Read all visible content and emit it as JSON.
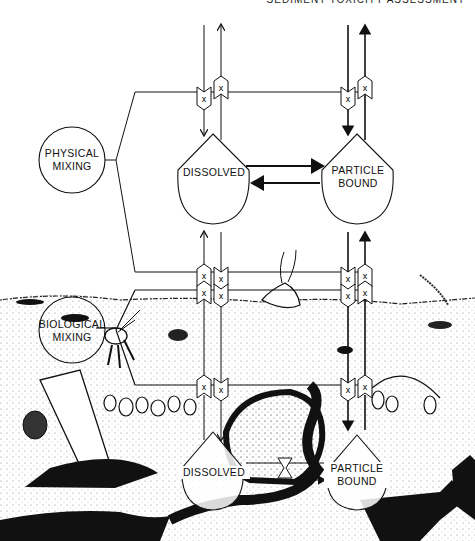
{
  "header": {
    "running_title": "SEDIMENT TOXICITY ASSESSMENT"
  },
  "diagram": {
    "water_column": {
      "physical_mixing": {
        "line1": "PHYSICAL",
        "line2": "MIXING"
      },
      "dissolved": {
        "label": "DISSOLVED"
      },
      "particle_bound": {
        "line1": "PARTICLE",
        "line2": "BOUND"
      }
    },
    "sediment": {
      "biological_mixing": {
        "line1": "BIOLOGICAL",
        "line2": "MIXING"
      },
      "dissolved": {
        "label": "DISSOLVED"
      },
      "particle_bound": {
        "line1": "PARTICLE",
        "line2": "BOUND"
      }
    },
    "gate_symbol": "X",
    "colors": {
      "ink": "#111111",
      "background": "#ffffff",
      "sediment_shade": "#1a1a1a"
    }
  }
}
